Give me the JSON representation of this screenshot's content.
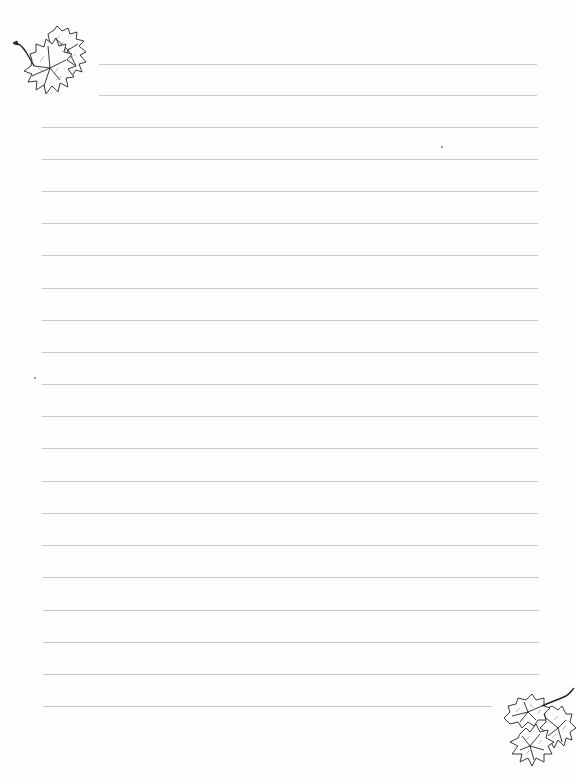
{
  "page": {
    "type": "lined-stationery",
    "background_color": "#fefefe",
    "line_color": "#c9c9c9",
    "line_count": 21,
    "line_spacing_px": 32.1
  },
  "decorations": [
    {
      "name": "leaf-cluster-top-left",
      "icon": "maple-leaf-icon",
      "position": "top-left"
    },
    {
      "name": "leaf-cluster-bottom-right",
      "icon": "maple-leaf-icon",
      "position": "bottom-right"
    }
  ],
  "lines": [
    {
      "y": 64,
      "x1": 99,
      "x2": 537
    },
    {
      "y": 95,
      "x1": 99,
      "x2": 537
    },
    {
      "y": 127,
      "x1": 42,
      "x2": 538
    },
    {
      "y": 159,
      "x1": 42,
      "x2": 538
    },
    {
      "y": 191,
      "x1": 42,
      "x2": 538
    },
    {
      "y": 223,
      "x1": 42,
      "x2": 538
    },
    {
      "y": 255,
      "x1": 42,
      "x2": 538
    },
    {
      "y": 288,
      "x1": 42,
      "x2": 538
    },
    {
      "y": 320,
      "x1": 42,
      "x2": 538
    },
    {
      "y": 352,
      "x1": 42,
      "x2": 538
    },
    {
      "y": 384,
      "x1": 42,
      "x2": 538
    },
    {
      "y": 416,
      "x1": 42,
      "x2": 538
    },
    {
      "y": 448,
      "x1": 42,
      "x2": 538
    },
    {
      "y": 481,
      "x1": 42,
      "x2": 538
    },
    {
      "y": 513,
      "x1": 42,
      "x2": 538
    },
    {
      "y": 545,
      "x1": 42,
      "x2": 538
    },
    {
      "y": 577,
      "x1": 43,
      "x2": 539
    },
    {
      "y": 610,
      "x1": 43,
      "x2": 539
    },
    {
      "y": 642,
      "x1": 43,
      "x2": 539
    },
    {
      "y": 674,
      "x1": 43,
      "x2": 539
    },
    {
      "y": 706,
      "x1": 43,
      "x2": 492
    }
  ]
}
